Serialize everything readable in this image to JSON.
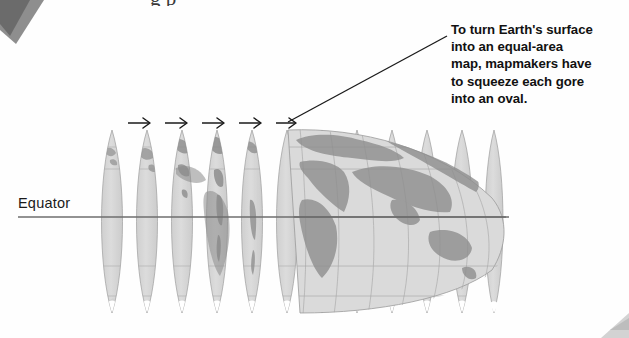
{
  "figure": {
    "type": "textbook-diagram",
    "background_color": "#fefefe",
    "top_cropped_heading": "g p",
    "callout": {
      "lines": [
        "To turn Earth's surface",
        "into an equal-area",
        "map, mapmakers have",
        "to squeeze each gore",
        "into an oval."
      ],
      "full_text": "To turn Earth's surface into an equal-area map, mapmakers have to squeeze each gore into an oval.",
      "text_color": "#111111",
      "leader_line": {
        "from_x": 288,
        "from_y": 122,
        "to_x": 447,
        "to_y": 36,
        "color": "#1a1a1a"
      }
    },
    "equator": {
      "label": "Equator",
      "label_color": "#1a1a1a",
      "line_color": "#6b6b6b",
      "line_y": 217,
      "line_from_x": 18,
      "line_to_x": 509
    },
    "arrows": {
      "count": 5,
      "glyph": "right-arrow",
      "color": "#1a1a1a",
      "y": 123,
      "x_positions": [
        128,
        165,
        202,
        239,
        276
      ],
      "length": 22
    },
    "gores": {
      "count": 12,
      "shape": "lens",
      "fill_color": "#d9d9d9",
      "outline_color": "#9a9a9a",
      "graticule_color": "#a8a8a8",
      "land_color": "#8f8f8f",
      "top_y": 130,
      "bottom_y": 313,
      "spacing": 35.4,
      "first_center_x": 112,
      "separated_count": 5,
      "merged_oval": {
        "left_x": 288,
        "right_x": 506,
        "description": "gores squeezed together into an oval"
      }
    },
    "latitude_lines_y": [
      169,
      217,
      266
    ],
    "page_artifacts": {
      "top_left_corner": {
        "color": "#6e6e6e",
        "description": "dark scanned page corner wedge"
      },
      "bottom_right_corner": {
        "color": "#d0d0d0",
        "description": "faint scanned page corner"
      }
    }
  }
}
